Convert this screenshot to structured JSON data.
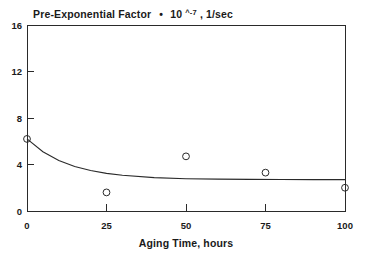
{
  "chart_data": {
    "type": "scatter",
    "title_parts": {
      "main": "Pre-Exponential Factor",
      "bullet": "•",
      "base": "10",
      "exponent": "^-7",
      "units": ", 1/sec"
    },
    "xlabel": "Aging Time, hours",
    "ylabel": "",
    "xlim": [
      0,
      100
    ],
    "ylim": [
      0,
      16
    ],
    "xticks": [
      0,
      25,
      50,
      75,
      100
    ],
    "yticks": [
      0,
      4,
      8,
      12,
      16
    ],
    "xtick_labels": [
      "0",
      "25",
      "50",
      "75",
      "100"
    ],
    "ytick_labels": [
      "0",
      "4",
      "8",
      "12",
      "16"
    ],
    "grid": false,
    "legend": null,
    "marker_style": "open-circle",
    "x": [
      0,
      25,
      50,
      75,
      100
    ],
    "values": [
      6.2,
      1.6,
      4.7,
      3.3,
      2.0
    ],
    "points": [
      {
        "x": 0,
        "y": 6.2
      },
      {
        "x": 25,
        "y": 1.6
      },
      {
        "x": 50,
        "y": 4.7
      },
      {
        "x": 75,
        "y": 3.3
      },
      {
        "x": 100,
        "y": 2.0
      }
    ],
    "series": [
      {
        "name": "Measured pre-exponential factor",
        "type": "scatter",
        "x": [
          0,
          25,
          50,
          75,
          100
        ],
        "values": [
          6.2,
          1.6,
          4.7,
          3.3,
          2.0
        ]
      },
      {
        "name": "Exponential decay fit",
        "type": "line",
        "description": "Decays from 6.2 at 0 hours to an asymptote of 2.7",
        "fit": {
          "y0": 6.2,
          "asymptote": 2.7,
          "decay_constant": 0.075
        },
        "x": [
          0,
          5,
          10,
          15,
          20,
          25,
          30,
          40,
          50,
          60,
          70,
          80,
          90,
          100
        ],
        "values": [
          6.2,
          5.1,
          4.35,
          3.83,
          3.48,
          3.24,
          3.07,
          2.87,
          2.78,
          2.74,
          2.72,
          2.71,
          2.7,
          2.7
        ]
      }
    ]
  },
  "colors": {
    "ink": "#2a2a2a",
    "background": "#ffffff"
  }
}
